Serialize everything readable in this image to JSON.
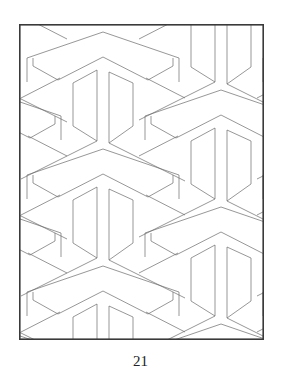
{
  "page": {
    "page_number": "21",
    "artwork": {
      "type": "coloring-page",
      "pattern": "interlocking Y-block tessellation",
      "frame": {
        "x": 19,
        "y": 24,
        "width": 245,
        "height": 316,
        "stroke": "#3a3a3a",
        "stroke_width": 1.6
      },
      "line_color": "#6a6a6a",
      "line_width": 0.7,
      "lattice": {
        "columns_x": [
          -15,
          103,
          221,
          339
        ],
        "first_apex_y": [
          -27,
          32,
          -27,
          32
        ],
        "period_y": 117
      },
      "motif": {
        "outer_chevron": [
          [
            -76,
            26
          ],
          [
            0,
            0
          ],
          [
            76,
            26
          ]
        ],
        "inner_chevron": [
          [
            -45,
            48
          ],
          [
            0,
            25
          ],
          [
            45,
            48
          ]
        ],
        "left_cap": [
          [
            -45,
            48
          ],
          [
            -70,
            34
          ],
          [
            -70,
            26
          ]
        ],
        "right_cap": [
          [
            45,
            48
          ],
          [
            70,
            34
          ],
          [
            70,
            26
          ]
        ],
        "left_outer_side": [
          [
            -76,
            26
          ],
          [
            -76,
            50
          ]
        ],
        "right_outer_side": [
          [
            76,
            26
          ],
          [
            76,
            50
          ]
        ],
        "stems": [
          [
            [
              -6,
              38
            ],
            [
              -6,
              109
            ]
          ],
          [
            [
              6,
              40
            ],
            [
              6,
              111
            ]
          ],
          [
            [
              -30,
              51
            ],
            [
              -30,
              94
            ]
          ],
          [
            [
              30,
              51
            ],
            [
              30,
              94
            ]
          ]
        ],
        "stem_joins": [
          [
            [
              -30,
              51
            ],
            [
              -6,
              38
            ]
          ],
          [
            [
              30,
              51
            ],
            [
              6,
              40
            ]
          ],
          [
            [
              -30,
              94
            ],
            [
              -6,
              109
            ]
          ],
          [
            [
              30,
              94
            ],
            [
              6,
              111
            ]
          ],
          [
            [
              -6,
              109
            ],
            [
              -82,
              147
            ]
          ],
          [
            [
              6,
              111
            ],
            [
              82,
              149
            ]
          ],
          [
            [
              -43,
              46
            ],
            [
              -82,
              66
            ]
          ],
          [
            [
              43,
              46
            ],
            [
              82,
              66
            ]
          ]
        ]
      }
    }
  }
}
